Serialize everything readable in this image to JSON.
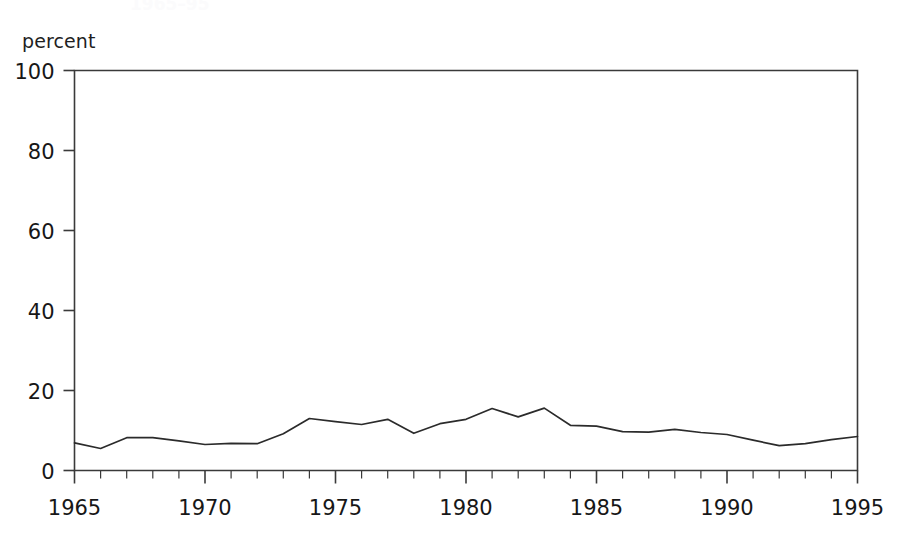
{
  "figure": {
    "axis_caption": "percent",
    "cropped_title": "1965–95"
  },
  "chart_data": {
    "type": "line",
    "title": "",
    "xlabel": "",
    "ylabel": "percent",
    "xlim": [
      1965,
      1995
    ],
    "ylim": [
      0,
      100
    ],
    "grid": false,
    "legend": "none",
    "x_tick_labels": [
      "1965",
      "1970",
      "1975",
      "1980",
      "1985",
      "1990",
      "1995"
    ],
    "x_tick_values": [
      1965,
      1970,
      1975,
      1980,
      1985,
      1990,
      1995
    ],
    "x_minor_tick_step": 1,
    "y_tick_labels": [
      "0",
      "20",
      "40",
      "60",
      "80",
      "100"
    ],
    "y_tick_values": [
      0,
      20,
      40,
      60,
      80,
      100
    ],
    "line_color": "#2b2b2b",
    "x": [
      1965,
      1966,
      1967,
      1968,
      1969,
      1970,
      1971,
      1972,
      1973,
      1974,
      1975,
      1976,
      1977,
      1978,
      1979,
      1980,
      1981,
      1982,
      1983,
      1984,
      1985,
      1986,
      1987,
      1988,
      1989,
      1990,
      1991,
      1992,
      1993,
      1994,
      1995
    ],
    "values": [
      6.9,
      5.5,
      8.2,
      8.2,
      7.4,
      6.5,
      6.8,
      6.7,
      9.2,
      13.0,
      12.2,
      11.5,
      12.8,
      9.3,
      11.7,
      12.8,
      15.5,
      13.4,
      15.6,
      11.3,
      11.1,
      9.7,
      9.6,
      10.3,
      9.5,
      9.0,
      7.6,
      6.2,
      6.7,
      7.7,
      8.5
    ],
    "series": [
      {
        "name": "percent",
        "values": [
          6.9,
          5.5,
          8.2,
          8.2,
          7.4,
          6.5,
          6.8,
          6.7,
          9.2,
          13.0,
          12.2,
          11.5,
          12.8,
          9.3,
          11.7,
          12.8,
          15.5,
          13.4,
          15.6,
          11.3,
          11.1,
          9.7,
          9.6,
          10.3,
          9.5,
          9.0,
          7.6,
          6.2,
          6.7,
          7.7,
          8.5
        ]
      }
    ]
  }
}
